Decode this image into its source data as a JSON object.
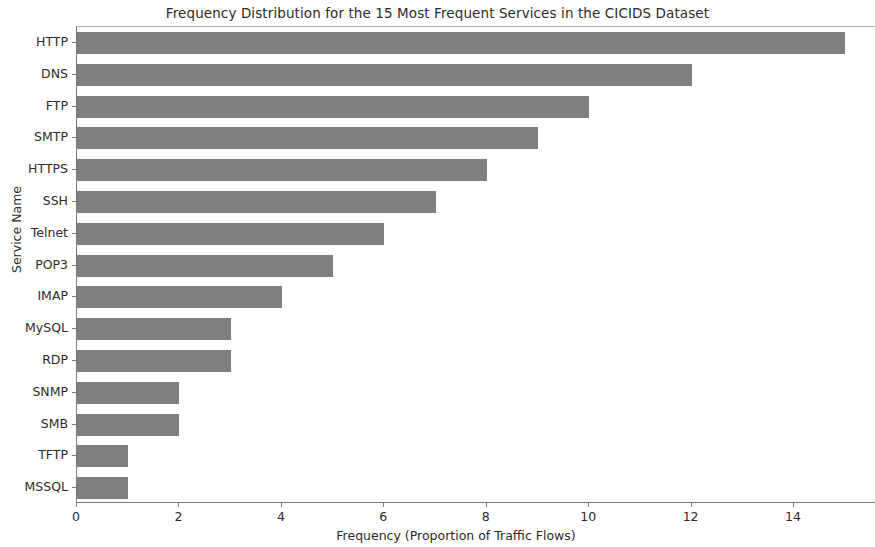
{
  "chart_data": {
    "type": "bar",
    "orientation": "horizontal",
    "title": "Frequency Distribution for the 15 Most Frequent Services in the CICIDS Dataset",
    "xlabel": "Frequency (Proportion of Traffic Flows)",
    "ylabel": "Service Name",
    "categories": [
      "HTTP",
      "DNS",
      "FTP",
      "SMTP",
      "HTTPS",
      "SSH",
      "Telnet",
      "POP3",
      "IMAP",
      "MySQL",
      "RDP",
      "SNMP",
      "SMB",
      "TFTP",
      "MSSQL"
    ],
    "values": [
      15,
      12,
      10,
      9,
      8,
      7,
      6,
      5,
      4,
      3,
      3,
      2,
      2,
      1,
      1
    ],
    "xticks": [
      0,
      2,
      4,
      6,
      8,
      10,
      12,
      14
    ],
    "xtick_labels": [
      "0",
      "2",
      "4",
      "6",
      "8",
      "10",
      "12",
      "14"
    ],
    "xlim": [
      0,
      15.6
    ],
    "grid": false,
    "legend": null,
    "bar_color": "#7f7f7f",
    "background_color": "#ffffff",
    "axis_color": "#7a7a7a",
    "text_color": "#2b2b2b"
  }
}
